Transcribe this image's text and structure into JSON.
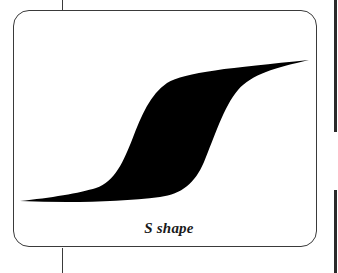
{
  "figure": {
    "caption": "S shape",
    "shape_name": "s-shape-hysteresis-loop",
    "colors": {
      "fill": "#000000",
      "border": "#3a3a3a",
      "background": "#ffffff"
    }
  }
}
